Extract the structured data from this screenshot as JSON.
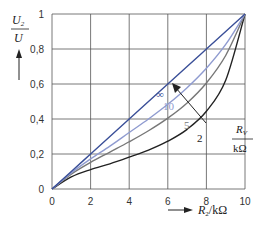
{
  "chart_data": {
    "type": "line",
    "title": "",
    "xlabel": "R2/kΩ",
    "ylabel": "U2/U",
    "xlim": [
      0,
      10
    ],
    "ylim": [
      0,
      1
    ],
    "grid": true,
    "x_ticks": [
      "0",
      "2",
      "4",
      "6",
      "8",
      "10"
    ],
    "y_ticks": [
      "0",
      "0,2",
      "0,4",
      "0,6",
      "0,8",
      "1"
    ],
    "x": [
      0,
      1,
      2,
      3,
      4,
      5,
      6,
      7,
      8,
      9,
      10
    ],
    "series": [
      {
        "name": "∞",
        "color": "#3a4f98",
        "values": [
          0,
          0.1,
          0.2,
          0.3,
          0.4,
          0.5,
          0.6,
          0.7,
          0.8,
          0.9,
          1.0
        ]
      },
      {
        "name": "10",
        "color": "#8f9bd0",
        "values": [
          0,
          0.092,
          0.172,
          0.245,
          0.323,
          0.4,
          0.484,
          0.579,
          0.69,
          0.826,
          1.0
        ]
      },
      {
        "name": "5",
        "color": "#777777",
        "values": [
          0,
          0.085,
          0.152,
          0.211,
          0.27,
          0.333,
          0.405,
          0.492,
          0.606,
          0.763,
          1.0
        ]
      },
      {
        "name": "2",
        "color": "#222222",
        "values": [
          0,
          0.069,
          0.111,
          0.144,
          0.182,
          0.222,
          0.273,
          0.341,
          0.444,
          0.621,
          1.0
        ]
      }
    ],
    "annotations": {
      "arrow_label_num": "R_V",
      "arrow_label_den": "kΩ",
      "y_axis_num": "U_2",
      "y_axis_den": "U",
      "x_axis_label": "R_2/kΩ"
    }
  }
}
